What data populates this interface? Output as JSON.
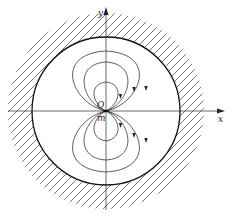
{
  "diagram": {
    "labels": {
      "y_axis": "y",
      "x_axis": "x",
      "origin": "O",
      "source": "m"
    },
    "colors": {
      "line": "#333333",
      "boundary": "#111111",
      "hatch": "#555555",
      "background": "#ffffff"
    },
    "geometry": {
      "center": [
        106,
        111
      ],
      "boundary_radius": 74,
      "loop_count_per_side": 3
    }
  }
}
